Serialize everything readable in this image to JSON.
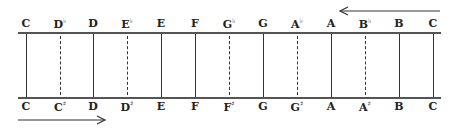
{
  "diagram": {
    "title": "",
    "top_labels": [
      {
        "name": "C",
        "acc": "",
        "x": 26,
        "type": "solid"
      },
      {
        "name": "D",
        "acc": "♭",
        "x": 60,
        "type": "dashed"
      },
      {
        "name": "D",
        "acc": "",
        "x": 93,
        "type": "solid"
      },
      {
        "name": "E",
        "acc": "♭",
        "x": 127,
        "type": "dashed"
      },
      {
        "name": "E",
        "acc": "",
        "x": 161,
        "type": "solid"
      },
      {
        "name": "F",
        "acc": "",
        "x": 195,
        "type": "solid"
      },
      {
        "name": "G",
        "acc": "♭",
        "x": 229,
        "type": "dashed"
      },
      {
        "name": "G",
        "acc": "",
        "x": 263,
        "type": "solid"
      },
      {
        "name": "A",
        "acc": "♭",
        "x": 297,
        "type": "dashed"
      },
      {
        "name": "A",
        "acc": "",
        "x": 331,
        "type": "solid"
      },
      {
        "name": "B",
        "acc": "♭",
        "x": 365,
        "type": "dashed"
      },
      {
        "name": "B",
        "acc": "",
        "x": 399,
        "type": "solid"
      },
      {
        "name": "C",
        "acc": "",
        "x": 433,
        "type": "solid"
      }
    ],
    "bottom_labels": [
      {
        "name": "C",
        "acc": ""
      },
      {
        "name": "C",
        "acc": "♯"
      },
      {
        "name": "D",
        "acc": ""
      },
      {
        "name": "D",
        "acc": "♯"
      },
      {
        "name": "E",
        "acc": ""
      },
      {
        "name": "F",
        "acc": ""
      },
      {
        "name": "F",
        "acc": "♯"
      },
      {
        "name": "G",
        "acc": ""
      },
      {
        "name": "G",
        "acc": "♯"
      },
      {
        "name": "A",
        "acc": ""
      },
      {
        "name": "A",
        "acc": "♯"
      },
      {
        "name": "B",
        "acc": ""
      },
      {
        "name": "C",
        "acc": ""
      }
    ],
    "arrows": {
      "top": {
        "direction": "left",
        "x1": 340,
        "x2": 440,
        "y": 11
      },
      "bottom": {
        "direction": "right",
        "x1": 18,
        "x2": 105,
        "y": 120
      }
    },
    "colors": {
      "line": "#333333",
      "text": "#222222",
      "background": "#ffffff"
    }
  }
}
